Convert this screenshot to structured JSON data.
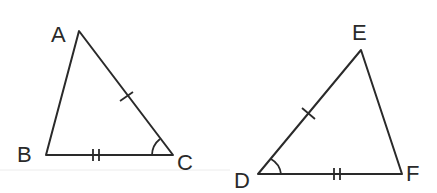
{
  "diagram": {
    "stroke_color": "#2a2a2a",
    "background": "#ffffff",
    "triangles": [
      {
        "name": "ABC",
        "vertices": {
          "A": {
            "label": "A",
            "x": 79,
            "y": 31
          },
          "B": {
            "label": "B",
            "x": 46,
            "y": 155
          },
          "C": {
            "label": "C",
            "x": 173,
            "y": 155
          }
        },
        "marks": {
          "single_tick_side": "AC",
          "double_tick_side": "BC",
          "angle_arc_vertex": "C"
        }
      },
      {
        "name": "DEF",
        "vertices": {
          "D": {
            "label": "D",
            "x": 258,
            "y": 174
          },
          "E": {
            "label": "E",
            "x": 361,
            "y": 50
          },
          "F": {
            "label": "F",
            "x": 402,
            "y": 174
          }
        },
        "marks": {
          "single_tick_side": "DE",
          "double_tick_side": "DF",
          "angle_arc_vertex": "D"
        }
      }
    ]
  }
}
